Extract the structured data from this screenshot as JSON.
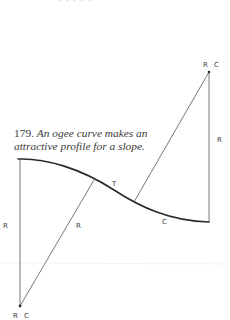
{
  "figure": {
    "top_fragment": "· · ·  · ·",
    "caption": {
      "number": "179.",
      "text_line1": "An ogee curve makes an",
      "text_line2": "attractive profile for a slope."
    },
    "labels": {
      "top_center": "R C",
      "bottom_center": "R C",
      "left_radius": "R",
      "middle_radius": "R",
      "right_radius": "R",
      "tangent_point": "T",
      "curve_label": "C"
    },
    "colors": {
      "ink": "#3a3a3a",
      "curve": "#2a2a2a",
      "thin_line": "#555555",
      "background": "#ffffff"
    },
    "geometry": {
      "curve_start": [
        18,
        159
      ],
      "curve_end": [
        209,
        222
      ],
      "tangent_point": [
        114,
        190
      ],
      "upper_center": [
        209,
        72
      ],
      "lower_center": [
        20,
        306
      ],
      "left_radius_foot": [
        94,
        180
      ],
      "right_radius_foot": [
        134,
        202
      ]
    }
  }
}
